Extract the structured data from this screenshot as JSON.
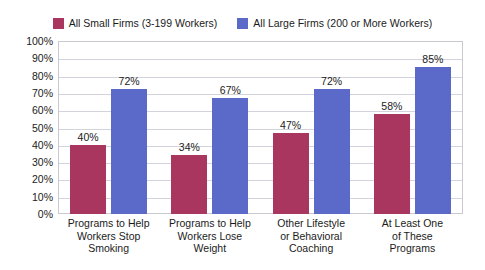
{
  "chart_data": {
    "type": "bar",
    "title": "",
    "subtitle": "",
    "xlabel": "",
    "ylabel": "",
    "ylim": [
      0,
      100
    ],
    "grid": true,
    "legend_position": "top-center",
    "y_ticks": [
      "0%",
      "10%",
      "20%",
      "30%",
      "40%",
      "50%",
      "60%",
      "70%",
      "80%",
      "90%",
      "100%"
    ],
    "y_tick_values": [
      0,
      10,
      20,
      30,
      40,
      50,
      60,
      70,
      80,
      90,
      100
    ],
    "categories": [
      [
        "Programs to Help",
        "Workers Stop",
        "Smoking"
      ],
      [
        "Programs to Help",
        "Workers Lose",
        "Weight"
      ],
      [
        "Other Lifestyle",
        "or Behavioral",
        "Coaching"
      ],
      [
        "At Least One",
        "of These",
        "Programs"
      ]
    ],
    "series": [
      {
        "name": "All Small Firms (3-199 Workers)",
        "color": "#a9365f",
        "values": [
          40,
          34,
          47,
          58
        ],
        "labels": [
          "40%",
          "34%",
          "47%",
          "58%"
        ]
      },
      {
        "name": "All Large Firms (200 or More Workers)",
        "color": "#5b6ac9",
        "values": [
          72,
          67,
          72,
          85
        ],
        "labels": [
          "72%",
          "67%",
          "72%",
          "85%"
        ]
      }
    ]
  },
  "legend": {
    "entries": [
      {
        "label": "All Small Firms (3-199 Workers)",
        "color": "#a9365f",
        "swatch_icon": "legend-swatch-icon"
      },
      {
        "label": "All Large Firms (200 or More Workers)",
        "color": "#5b6ac9",
        "swatch_icon": "legend-swatch-icon"
      }
    ]
  }
}
